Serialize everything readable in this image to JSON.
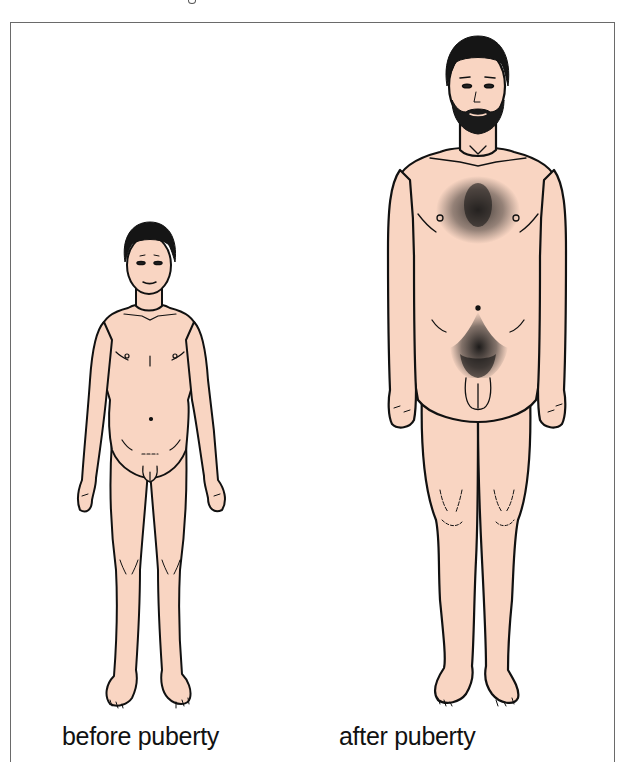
{
  "figure": {
    "title_clipped": "",
    "colors": {
      "skin": "#F9D5C2",
      "outline": "#111111",
      "hair": "#151515",
      "frame_border": "#6A6A6A",
      "background": "#FFFFFF"
    },
    "panels": [
      {
        "id": "before",
        "label": "before puberty",
        "subject": "boy, shorter stature, no body hair"
      },
      {
        "id": "after",
        "label": "after puberty",
        "subject": "adult man, taller stature, beard, chest hair, pubic hair"
      }
    ]
  }
}
